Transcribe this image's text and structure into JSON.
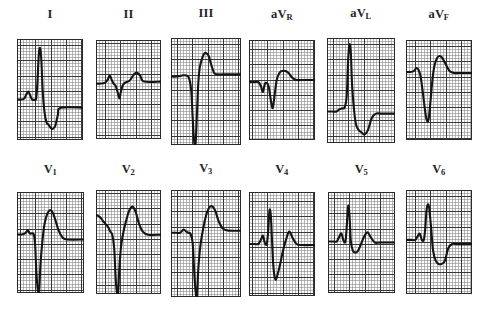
{
  "figure": {
    "kind": "12-lead-electrocardiogram",
    "rows": 2,
    "columns": 6,
    "background_color": "#ffffff",
    "grid_fine_color": "#8c8c8c",
    "grid_bold_color": "#2b2b2b",
    "trace_color": "#141414",
    "label_color": "#262626"
  },
  "chart_data": {
    "type": "line",
    "title": "",
    "xlabel": "",
    "ylabel": "",
    "grid": true,
    "legend": "none",
    "panels": [
      {
        "label": "I",
        "label_main": "I",
        "label_sub": "",
        "row": 0,
        "column": 0,
        "morphology": "small P wave, tall narrow R wave, deep S wave, inverted T wave",
        "x": [
          0,
          6,
          11,
          14,
          17,
          20,
          23,
          26,
          29,
          31,
          33,
          35,
          37,
          39,
          42,
          45,
          48,
          51,
          54,
          58,
          62,
          66,
          100
        ],
        "y": [
          60,
          60,
          59,
          55,
          52,
          56,
          60,
          60,
          59,
          42,
          16,
          9,
          22,
          52,
          74,
          83,
          85,
          88,
          89,
          86,
          75,
          68,
          68
        ]
      },
      {
        "label": "II",
        "label_main": "II",
        "label_sub": "",
        "row": 0,
        "column": 1,
        "morphology": "low voltage, small P, shallow QS complex, low rounded T",
        "x": [
          0,
          8,
          14,
          18,
          21,
          24,
          27,
          30,
          33,
          36,
          38,
          41,
          45,
          49,
          53,
          57,
          62,
          68,
          74,
          100
        ],
        "y": [
          44,
          44,
          43,
          40,
          36,
          40,
          44,
          46,
          52,
          59,
          53,
          46,
          43,
          42,
          40,
          36,
          33,
          36,
          42,
          42
        ]
      },
      {
        "label": "III",
        "label_main": "III",
        "label_sub": "",
        "row": 0,
        "column": 2,
        "morphology": "flat baseline, very deep QS complex, tall positive T wave",
        "x": [
          0,
          8,
          16,
          22,
          26,
          29,
          31,
          33,
          35,
          37,
          39,
          41,
          44,
          47,
          50,
          54,
          58,
          62,
          68,
          74,
          100
        ],
        "y": [
          36,
          36,
          35,
          35,
          38,
          50,
          75,
          96,
          100,
          72,
          42,
          28,
          20,
          15,
          14,
          17,
          26,
          33,
          34,
          34,
          34
        ]
      },
      {
        "label": "aVR",
        "label_main": "aV",
        "label_sub": "R",
        "row": 0,
        "column": 3,
        "morphology": "baseline with small notch, moderate Q dip, rounded positive T",
        "x": [
          0,
          8,
          14,
          18,
          21,
          24,
          27,
          30,
          33,
          36,
          39,
          42,
          46,
          50,
          55,
          60,
          66,
          72,
          80,
          100
        ],
        "y": [
          42,
          42,
          42,
          46,
          52,
          44,
          43,
          47,
          60,
          68,
          54,
          40,
          33,
          31,
          31,
          33,
          38,
          40,
          40,
          40
        ]
      },
      {
        "label": "aVL",
        "label_main": "aV",
        "label_sub": "L",
        "row": 0,
        "column": 4,
        "morphology": "very tall narrow R wave, deep S wave, inverted T wave",
        "x": [
          0,
          8,
          14,
          18,
          22,
          26,
          29,
          31,
          33,
          35,
          37,
          40,
          43,
          47,
          51,
          55,
          60,
          66,
          72,
          80,
          100
        ],
        "y": [
          70,
          70,
          70,
          68,
          67,
          66,
          55,
          22,
          6,
          14,
          46,
          70,
          83,
          88,
          90,
          92,
          88,
          76,
          72,
          72,
          72
        ]
      },
      {
        "label": "aVF",
        "label_main": "aV",
        "label_sub": "F",
        "row": 0,
        "column": 5,
        "morphology": "small P, deep Q/S dip, tall rounded positive T wave",
        "x": [
          0,
          7,
          12,
          16,
          19,
          22,
          25,
          28,
          31,
          34,
          37,
          40,
          43,
          47,
          51,
          55,
          60,
          66,
          73,
          80,
          100
        ],
        "y": [
          32,
          32,
          31,
          28,
          30,
          36,
          50,
          66,
          79,
          80,
          62,
          40,
          26,
          18,
          16,
          18,
          24,
          31,
          33,
          33,
          33
        ]
      },
      {
        "label": "V1",
        "label_main": "V",
        "label_sub": "1",
        "row": 1,
        "column": 0,
        "morphology": "rS pattern with very deep S wave, tall broad T wave",
        "x": [
          0,
          7,
          12,
          16,
          19,
          22,
          25,
          27,
          29,
          31,
          33,
          35,
          38,
          41,
          45,
          49,
          53,
          57,
          62,
          68,
          75,
          100
        ],
        "y": [
          42,
          42,
          41,
          38,
          41,
          41,
          42,
          52,
          80,
          97,
          99,
          72,
          48,
          32,
          22,
          18,
          20,
          27,
          38,
          45,
          47,
          47
        ]
      },
      {
        "label": "V2",
        "label_main": "V",
        "label_sub": "2",
        "row": 1,
        "column": 1,
        "morphology": "descending baseline, very deep S wave, tall peaked T wave",
        "x": [
          0,
          6,
          11,
          15,
          19,
          22,
          25,
          28,
          30,
          32,
          34,
          36,
          39,
          43,
          47,
          51,
          56,
          61,
          66,
          72,
          80,
          100
        ],
        "y": [
          24,
          26,
          30,
          33,
          36,
          40,
          43,
          56,
          82,
          98,
          100,
          74,
          52,
          38,
          28,
          20,
          16,
          21,
          32,
          40,
          43,
          43
        ]
      },
      {
        "label": "V3",
        "label_main": "V",
        "label_sub": "3",
        "row": 1,
        "column": 2,
        "morphology": "flat baseline with small notch, very deep S wave, tall T wave",
        "x": [
          0,
          7,
          13,
          18,
          22,
          25,
          28,
          31,
          33,
          35,
          37,
          39,
          42,
          46,
          50,
          54,
          58,
          63,
          68,
          74,
          82,
          100
        ],
        "y": [
          40,
          40,
          40,
          37,
          39,
          40,
          41,
          50,
          74,
          94,
          100,
          74,
          52,
          36,
          24,
          17,
          15,
          19,
          29,
          36,
          38,
          38
        ]
      },
      {
        "label": "V4",
        "label_main": "V",
        "label_sub": "4",
        "row": 1,
        "column": 3,
        "morphology": "small P wave, tall narrow R spike, deep S wave, positive T wave",
        "x": [
          0,
          8,
          14,
          18,
          21,
          24,
          27,
          29,
          31,
          33,
          35,
          37,
          40,
          43,
          47,
          51,
          56,
          61,
          66,
          72,
          80,
          100
        ],
        "y": [
          50,
          50,
          50,
          46,
          42,
          49,
          50,
          38,
          18,
          22,
          48,
          72,
          84,
          80,
          70,
          58,
          46,
          38,
          44,
          50,
          51,
          51
        ]
      },
      {
        "label": "V5",
        "label_main": "V",
        "label_sub": "5",
        "row": 1,
        "column": 4,
        "morphology": "small P, tall narrow R wave, shallow S, low rounded T wave",
        "x": [
          0,
          8,
          13,
          17,
          20,
          23,
          26,
          28,
          30,
          32,
          34,
          37,
          41,
          45,
          49,
          54,
          59,
          64,
          70,
          78,
          100
        ],
        "y": [
          49,
          49,
          49,
          44,
          41,
          48,
          49,
          34,
          14,
          22,
          48,
          58,
          60,
          58,
          52,
          44,
          40,
          45,
          50,
          50,
          50
        ]
      },
      {
        "label": "V6",
        "label_main": "V",
        "label_sub": "6",
        "row": 1,
        "column": 5,
        "morphology": "small P, tall broad R wave, ST depression with flat negative T",
        "x": [
          0,
          8,
          14,
          18,
          21,
          24,
          27,
          29,
          31,
          33,
          35,
          38,
          41,
          45,
          49,
          54,
          59,
          64,
          70,
          78,
          100
        ],
        "y": [
          48,
          48,
          48,
          44,
          42,
          48,
          48,
          38,
          20,
          14,
          17,
          36,
          58,
          68,
          71,
          71,
          68,
          56,
          52,
          52,
          52
        ]
      }
    ]
  },
  "layout": {
    "panels": [
      {
        "grid_left": 17,
        "grid_top": 39,
        "grid_width": 66,
        "grid_height": 101,
        "label_top": 8,
        "cell": 3.05,
        "bold_every": 5,
        "bold_offset_x": 1,
        "bold_offset_y": 2
      },
      {
        "grid_left": 96,
        "grid_top": 40,
        "grid_width": 65,
        "grid_height": 99,
        "label_top": 8,
        "cell": 3.05,
        "bold_every": 5,
        "bold_offset_x": 3,
        "bold_offset_y": 1
      },
      {
        "grid_left": 171,
        "grid_top": 38,
        "grid_width": 70,
        "grid_height": 107,
        "label_top": 7,
        "cell": 3.05,
        "bold_every": 5,
        "bold_offset_x": 2,
        "bold_offset_y": 2
      },
      {
        "grid_left": 249,
        "grid_top": 40,
        "grid_width": 66,
        "grid_height": 100,
        "label_top": 8,
        "cell": 3.05,
        "bold_every": 5,
        "bold_offset_x": 1,
        "bold_offset_y": 3
      },
      {
        "grid_left": 327,
        "grid_top": 38,
        "grid_width": 68,
        "grid_height": 105,
        "label_top": 7,
        "cell": 3.05,
        "bold_every": 5,
        "bold_offset_x": 2,
        "bold_offset_y": 2
      },
      {
        "grid_left": 406,
        "grid_top": 40,
        "grid_width": 66,
        "grid_height": 100,
        "label_top": 8,
        "cell": 3.05,
        "bold_every": 5,
        "bold_offset_x": 3,
        "bold_offset_y": 2
      },
      {
        "grid_left": 17,
        "grid_top": 192,
        "grid_width": 67,
        "grid_height": 101,
        "label_top": 163,
        "cell": 3.05,
        "bold_every": 5,
        "bold_offset_x": 1,
        "bold_offset_y": 2
      },
      {
        "grid_left": 96,
        "grid_top": 190,
        "grid_width": 65,
        "grid_height": 104,
        "label_top": 163,
        "cell": 3.05,
        "bold_every": 5,
        "bold_offset_x": 3,
        "bold_offset_y": 1
      },
      {
        "grid_left": 171,
        "grid_top": 190,
        "grid_width": 70,
        "grid_height": 107,
        "label_top": 162,
        "cell": 3.05,
        "bold_every": 5,
        "bold_offset_x": 2,
        "bold_offset_y": 2
      },
      {
        "grid_left": 249,
        "grid_top": 192,
        "grid_width": 66,
        "grid_height": 104,
        "label_top": 163,
        "cell": 3.05,
        "bold_every": 5,
        "bold_offset_x": 1,
        "bold_offset_y": 3
      },
      {
        "grid_left": 328,
        "grid_top": 192,
        "grid_width": 67,
        "grid_height": 101,
        "label_top": 163,
        "cell": 3.05,
        "bold_every": 5,
        "bold_offset_x": 2,
        "bold_offset_y": 2
      },
      {
        "grid_left": 406,
        "grid_top": 190,
        "grid_width": 66,
        "grid_height": 104,
        "label_top": 163,
        "cell": 3.05,
        "bold_every": 5,
        "bold_offset_x": 3,
        "bold_offset_y": 2
      }
    ]
  }
}
